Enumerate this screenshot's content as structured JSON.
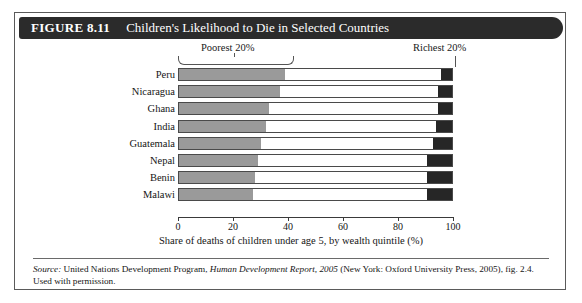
{
  "figure": {
    "number": "FIGURE 8.11",
    "title": "Children's Likelihood to Die in Selected Countries"
  },
  "source": {
    "label": "Source:",
    "text_before_italic": " United Nations Development Program, ",
    "italic_title": "Human Development Report, 2005",
    "text_after_italic": " (New York: Oxford University Press, 2005), fig. 2.4. Used with permission."
  },
  "chart_data": {
    "type": "bar",
    "orientation": "horizontal",
    "stacked": true,
    "title": "Children's Likelihood to Die in Selected Countries",
    "xlabel": "Share of deaths of children under age 5, by wealth quintile (%)",
    "ylabel": "",
    "xlim": [
      0,
      100
    ],
    "xticks": [
      0,
      20,
      40,
      60,
      80,
      100
    ],
    "xtick_labels": [
      "0",
      "20",
      "40",
      "60",
      "80",
      "100"
    ],
    "grid": false,
    "legend_position": "top",
    "annotations": [
      {
        "text": "Poorest 20%",
        "points_to": "first-segment"
      },
      {
        "text": "Richest 20%",
        "points_to": "last-segment"
      }
    ],
    "categories": [
      "Peru",
      "Nicaragua",
      "Ghana",
      "India",
      "Guatemala",
      "Nepal",
      "Benin",
      "Malawi"
    ],
    "series": [
      {
        "name": "Poorest 20%",
        "color": "#9a9a9a",
        "values": [
          39,
          37,
          33,
          32,
          30,
          29,
          28,
          27
        ]
      },
      {
        "name": "Middle 60%",
        "color": "#ffffff",
        "values": [
          57,
          58,
          62,
          62,
          63,
          62,
          63,
          64
        ]
      },
      {
        "name": "Richest 20%",
        "color": "#262626",
        "values": [
          4,
          5,
          5,
          6,
          7,
          9,
          9,
          9
        ]
      }
    ]
  }
}
